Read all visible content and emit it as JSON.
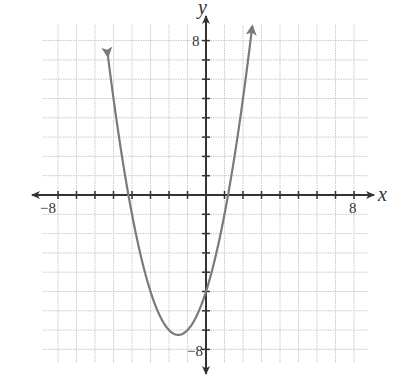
{
  "chart_data": {
    "type": "line",
    "title": "",
    "xlabel": "x",
    "ylabel": "y",
    "xlim": [
      -8,
      8
    ],
    "ylim": [
      -8,
      8
    ],
    "grid": true,
    "tick_step": 1,
    "tick_labels": {
      "x": [
        {
          "value": -8,
          "label": "−8"
        },
        {
          "value": 8,
          "label": "8"
        }
      ],
      "y": [
        {
          "value": 8,
          "label": "8"
        },
        {
          "value": -8,
          "label": "−8"
        }
      ]
    },
    "series": [
      {
        "name": "parabola",
        "equation": "y = x^2 + 3x - 5",
        "coefficients": {
          "a": 1,
          "b": 3,
          "c": -5
        },
        "vertex": [
          -1.5,
          -7.25
        ],
        "x_intercepts": [
          -4.19,
          1.19
        ],
        "y_intercept": -5,
        "x_range": [
          -5.3,
          2.5
        ],
        "arrows_at_ends": true,
        "color": "#7a7a7a"
      }
    ],
    "legend": null
  },
  "labels": {
    "x_axis": "x",
    "y_axis": "y",
    "x_min": "−8",
    "x_max": "8",
    "y_max": "8",
    "y_min": "−8"
  }
}
